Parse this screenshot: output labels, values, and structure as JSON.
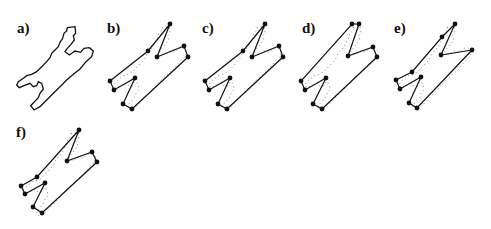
{
  "figure": {
    "panels": [
      {
        "id": "a",
        "label": "a)",
        "kind": "contour"
      },
      {
        "id": "b",
        "label": "b)",
        "kind": "polygon"
      },
      {
        "id": "c",
        "label": "c)",
        "kind": "polygon"
      },
      {
        "id": "d",
        "label": "d)",
        "kind": "polygon"
      },
      {
        "id": "e",
        "label": "e)",
        "kind": "polygon"
      },
      {
        "id": "f",
        "label": "f)",
        "kind": "polygon"
      }
    ]
  },
  "colors": {
    "ink": "#111111",
    "dots": "#777777"
  }
}
